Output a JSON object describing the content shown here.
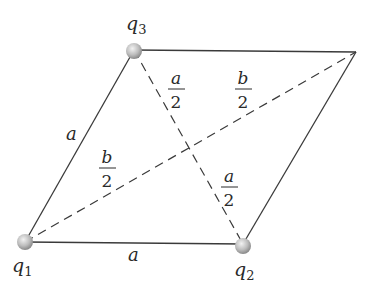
{
  "diagram": {
    "charges": [
      {
        "id": "q1",
        "symbol": "q",
        "subscript": "1"
      },
      {
        "id": "q2",
        "symbol": "q",
        "subscript": "2"
      },
      {
        "id": "q3",
        "symbol": "q",
        "subscript": "3"
      }
    ],
    "side_labels": {
      "left": "a",
      "bottom": "a"
    },
    "half_diagonal_labels": {
      "short_upper": {
        "num": "a",
        "den": "2"
      },
      "short_lower": {
        "num": "a",
        "den": "2"
      },
      "long_left": {
        "num": "b",
        "den": "2"
      },
      "long_right": {
        "num": "b",
        "den": "2"
      }
    },
    "colors": {
      "line": "#3a3a3a",
      "charge_fill": "#bdbdbd",
      "background": "#ffffff"
    }
  }
}
